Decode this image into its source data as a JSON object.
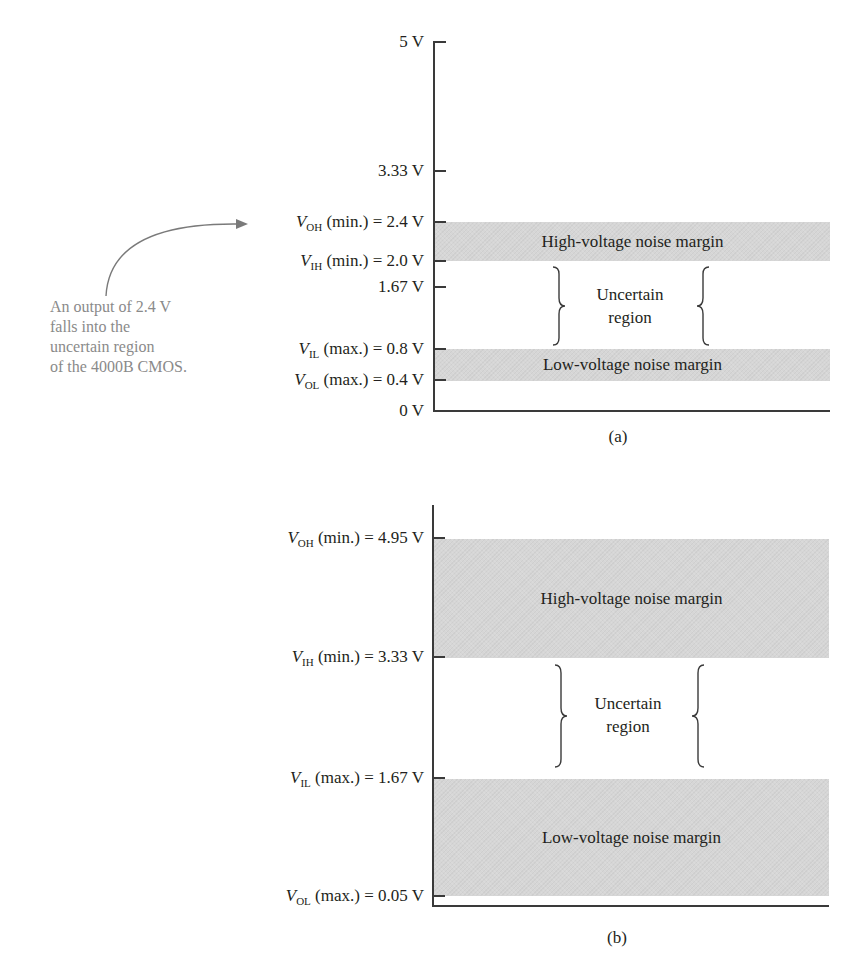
{
  "diagram_a": {
    "caption": "(a)",
    "ticks": [
      {
        "label_plain": "5 V",
        "value": 5.0
      },
      {
        "label_plain": "3.33 V",
        "value": 3.33
      },
      {
        "symbol": "V",
        "sub": "OH",
        "qualifier": " (min.) = 2.4 V",
        "value": 2.4
      },
      {
        "symbol": "V",
        "sub": "IH",
        "qualifier": " (min.) = 2.0 V",
        "value": 2.0
      },
      {
        "label_plain": "1.67 V",
        "value": 1.67
      },
      {
        "symbol": "V",
        "sub": "IL",
        "qualifier": " (max.) = 0.8 V",
        "value": 0.8
      },
      {
        "symbol": "V",
        "sub": "OL",
        "qualifier": " (max.) = 0.4 V",
        "value": 0.4
      },
      {
        "label_plain": "0 V",
        "value": 0.0
      }
    ],
    "bands": {
      "high": {
        "label": "High-voltage noise margin",
        "from": 2.0,
        "to": 2.4
      },
      "low": {
        "label": "Low-voltage noise margin",
        "from": 0.4,
        "to": 0.8
      }
    },
    "uncertain": {
      "line1": "Uncertain",
      "line2": "region",
      "from": 0.8,
      "to": 2.0
    },
    "annotation": {
      "lines": [
        "An output of 2.4 V",
        "falls into the",
        "uncertain region",
        "of the 4000B CMOS."
      ],
      "points_to": "VOH (min.) = 2.4 V"
    }
  },
  "diagram_b": {
    "caption": "(b)",
    "ticks": [
      {
        "symbol": "V",
        "sub": "OH",
        "qualifier": " (min.) = 4.95 V",
        "value": 4.95
      },
      {
        "symbol": "V",
        "sub": "IH",
        "qualifier": " (min.) = 3.33 V",
        "value": 3.33
      },
      {
        "symbol": "V",
        "sub": "IL",
        "qualifier": " (max.) = 1.67 V",
        "value": 1.67
      },
      {
        "symbol": "V",
        "sub": "OL",
        "qualifier": " (max.) = 0.05 V",
        "value": 0.05
      }
    ],
    "bands": {
      "high": {
        "label": "High-voltage noise margin",
        "from": 3.33,
        "to": 4.95
      },
      "low": {
        "label": "Low-voltage noise margin",
        "from": 0.05,
        "to": 1.67
      }
    },
    "uncertain": {
      "line1": "Uncertain",
      "line2": "region",
      "from": 1.67,
      "to": 3.33
    }
  },
  "colors": {
    "band_fill": "#d6d6d6",
    "axis": "#3a3a3a",
    "annotation_text": "#8a8a8a",
    "text": "#231f20"
  }
}
